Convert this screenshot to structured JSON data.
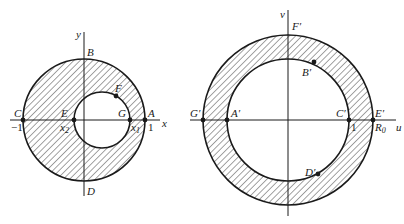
{
  "left_figure": {
    "axes": {
      "x_label": "x",
      "y_label": "y"
    },
    "outer_circle": {
      "cx": 84,
      "cy": 120,
      "r": 61
    },
    "inner_circle": {
      "cx": 102,
      "cy": 120,
      "r": 28
    },
    "points": {
      "A": {
        "label": "A",
        "tick": "1"
      },
      "B": {
        "label": "B"
      },
      "C": {
        "label": "C",
        "tick": "−1"
      },
      "D": {
        "label": "D"
      },
      "E": {
        "label": "E",
        "sub_base": "x",
        "sub": "2"
      },
      "F": {
        "label": "F"
      },
      "G": {
        "label": "G",
        "sub_base": "x",
        "sub": "1"
      }
    }
  },
  "right_figure": {
    "axes": {
      "x_label": "u",
      "y_label": "v"
    },
    "outer_circle": {
      "cx": 288,
      "cy": 120,
      "r": 85
    },
    "inner_circle": {
      "cx": 288,
      "cy": 120,
      "r": 61
    },
    "points": {
      "A": {
        "label": "A′"
      },
      "B": {
        "label": "B′"
      },
      "C": {
        "label": "C′",
        "tick": "1"
      },
      "D": {
        "label": "D′"
      },
      "E": {
        "label": "E′",
        "sub_base": "R",
        "sub": "0"
      },
      "F": {
        "label": "F′"
      },
      "G": {
        "label": "G′"
      }
    }
  },
  "colors": {
    "ink": "#1a1a1a",
    "hatch": "#333333",
    "background": "#ffffff"
  }
}
